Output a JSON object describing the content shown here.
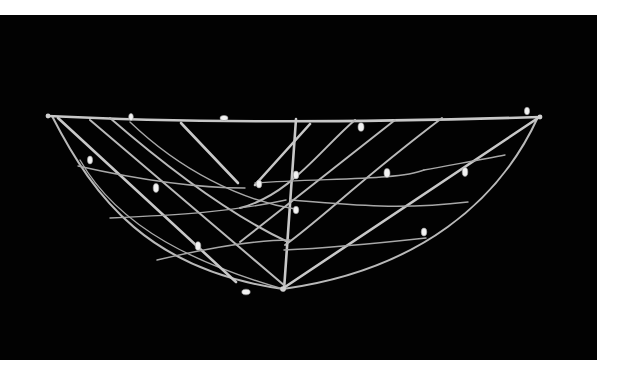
{
  "image": {
    "subject": "Marshall Islands stick chart",
    "alt": "Navigation stick chart made of crossed sticks with cowrie shells on a black background",
    "background_color": "#020202",
    "border_color": "#ffffff",
    "stick_color": "#bdbdbd",
    "shell_color": "#f2f2f2"
  },
  "shells": [
    {
      "x": 90,
      "y": 160
    },
    {
      "x": 131,
      "y": 117
    },
    {
      "x": 156,
      "y": 188
    },
    {
      "x": 189,
      "y": 118
    },
    {
      "x": 198,
      "y": 246
    },
    {
      "x": 224,
      "y": 118
    },
    {
      "x": 259,
      "y": 184
    },
    {
      "x": 296,
      "y": 175
    },
    {
      "x": 353,
      "y": 175
    },
    {
      "x": 297,
      "y": 209
    },
    {
      "x": 361,
      "y": 127
    },
    {
      "x": 387,
      "y": 173
    },
    {
      "x": 424,
      "y": 232
    },
    {
      "x": 465,
      "y": 172
    },
    {
      "x": 527,
      "y": 111
    },
    {
      "x": 246,
      "y": 292
    }
  ]
}
